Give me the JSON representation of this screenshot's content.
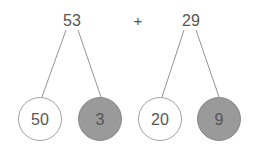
{
  "diagram": {
    "operator": "+",
    "left": {
      "whole": "53",
      "parts": [
        {
          "value": "50",
          "shaded": false
        },
        {
          "value": "3",
          "shaded": true
        }
      ]
    },
    "right": {
      "whole": "29",
      "parts": [
        {
          "value": "20",
          "shaded": false
        },
        {
          "value": "9",
          "shaded": true
        }
      ]
    },
    "colors": {
      "line": "#777777",
      "text": "#555555",
      "shaded_fill": "#999999",
      "unshaded_fill": "#ffffff"
    }
  }
}
